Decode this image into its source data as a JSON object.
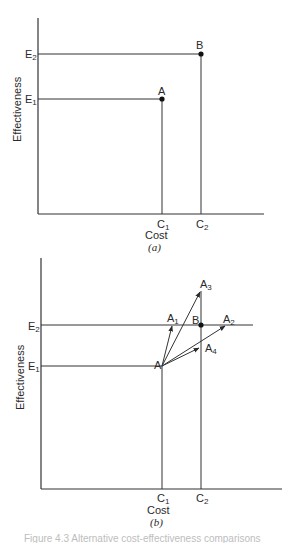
{
  "figure": {
    "caption_partial": "Figure 4.3  Alternative cost-effectiveness comparisons",
    "panels": [
      {
        "id": "a",
        "label": "(a)",
        "xlabel": "Cost",
        "ylabel": "Effectiveness",
        "x_ticks": [
          "C1",
          "C2"
        ],
        "y_ticks": [
          "E1",
          "E2"
        ],
        "points": [
          {
            "name": "A",
            "cost": "C1",
            "effectiveness": "E1"
          },
          {
            "name": "B",
            "cost": "C2",
            "effectiveness": "E2"
          }
        ]
      },
      {
        "id": "b",
        "label": "(b)",
        "xlabel": "Cost",
        "ylabel": "Effectiveness",
        "x_ticks": [
          "C1",
          "C2"
        ],
        "y_ticks": [
          "E1",
          "E2"
        ],
        "points": [
          {
            "name": "A",
            "cost": "C1",
            "effectiveness": "E1"
          },
          {
            "name": "B",
            "cost": "C2",
            "effectiveness": "E2"
          }
        ],
        "arrows_from_A": [
          "A1",
          "A2",
          "A3",
          "A4"
        ]
      }
    ]
  },
  "labels": {
    "ylabel": "Effectiveness",
    "xlabel": "Cost",
    "E": "E",
    "C": "C",
    "A": "A",
    "B": "B",
    "s1": "1",
    "s2": "2",
    "s3": "3",
    "s4": "4",
    "panel_a": "(a)",
    "panel_b": "(b)"
  }
}
